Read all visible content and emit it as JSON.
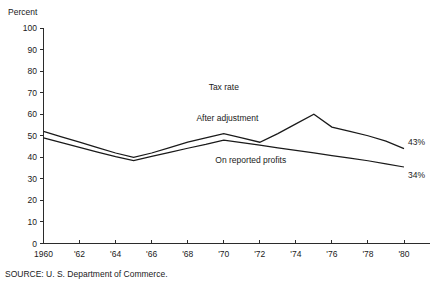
{
  "chart_data": {
    "type": "line",
    "title": "",
    "subtitle": "",
    "xlabel": "",
    "ylabel": "Percent",
    "axis_title_text": "Percent",
    "grid": false,
    "legend_position": "inline-annotations",
    "xlim": [
      1960,
      1980
    ],
    "ylim": [
      0,
      100
    ],
    "ytick_values": [
      0,
      10,
      20,
      30,
      40,
      50,
      60,
      70,
      80,
      90,
      100
    ],
    "ytick_labels": [
      "0",
      "10",
      "20",
      "30",
      "40",
      "50",
      "60",
      "70",
      "80",
      "90",
      "100"
    ],
    "xtick_values": [
      1960,
      1962,
      1964,
      1966,
      1968,
      1970,
      1972,
      1974,
      1976,
      1978,
      1980
    ],
    "xtick_labels": [
      "1960",
      "'62",
      "'64",
      "'66",
      "'68",
      "'70",
      "'72",
      "'74",
      "'76",
      "'78",
      "'80"
    ],
    "x": [
      1960,
      1961,
      1962,
      1963,
      1964,
      1965,
      1966,
      1967,
      1968,
      1969,
      1970,
      1971,
      1972,
      1973,
      1974,
      1975,
      1976,
      1977,
      1978,
      1979,
      1980
    ],
    "series": [
      {
        "name": "After adjustment",
        "values": [
          52,
          49.5,
          47,
          44.5,
          42,
          40,
          42,
          44.5,
          47,
          49,
          51,
          49,
          47,
          51,
          55.5,
          60,
          54,
          52,
          50,
          47.5,
          44
        ],
        "end_label": "43%",
        "annotation_label": "After adjustment"
      },
      {
        "name": "On reported profits",
        "values": [
          49,
          46.8,
          44.6,
          42.4,
          40.3,
          38.5,
          40.4,
          42.3,
          44.2,
          46,
          48,
          46.8,
          45.6,
          44.4,
          43.2,
          42,
          40.8,
          39.6,
          38.4,
          37,
          35.5
        ],
        "end_label": "34%",
        "annotation_label": "On reported profits"
      }
    ],
    "annotations": [
      {
        "text": "Tax rate",
        "x": 1970,
        "y": 71
      },
      {
        "text": "After adjustment",
        "x": 1970.2,
        "y": 57
      },
      {
        "text": "On reported profits",
        "x": 1971.5,
        "y": 37.5
      }
    ],
    "end_labels": [
      {
        "text": "43%",
        "series": "After adjustment"
      },
      {
        "text": "34%",
        "series": "On reported profits"
      }
    ],
    "source": "SOURCE: U. S. Department of Commerce.",
    "colors": {
      "line": "#1a1a1a",
      "axis": "#2b2b2b",
      "background": "#ffffff"
    }
  }
}
